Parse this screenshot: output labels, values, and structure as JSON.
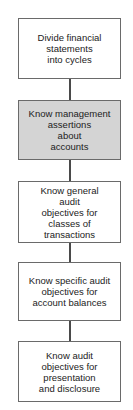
{
  "flowchart": {
    "steps": [
      {
        "label": "Divide financial\nstatements\ninto cycles",
        "highlighted": false
      },
      {
        "label": "Know management\nassertions\nabout\naccounts",
        "highlighted": true
      },
      {
        "label": "Know general\naudit\nobjectives for\nclasses of\ntransactions",
        "highlighted": false
      },
      {
        "label": "Know specific audit\nobjectives for\naccount balances",
        "highlighted": false
      },
      {
        "label": "Know audit\nobjectives for\npresentation\nand disclosure",
        "highlighted": false
      }
    ],
    "colors": {
      "highlight_fill": "#d4d4d4",
      "border": "#6a6a6a",
      "connector": "#4a4a4a"
    }
  }
}
